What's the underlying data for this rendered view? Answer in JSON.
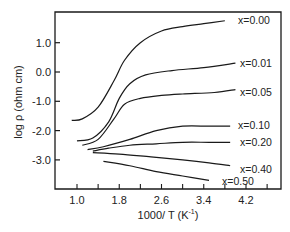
{
  "chart_data": {
    "type": "line",
    "title": "",
    "xlabel": "1000/ T (K⁻¹)",
    "ylabel": "log ρ (ohm cm)",
    "xlim": [
      0.6,
      4.6
    ],
    "ylim": [
      -4.0,
      2.1
    ],
    "xticks": [
      1.0,
      1.8,
      2.6,
      3.4,
      4.2
    ],
    "xtick_labels": [
      "1.0",
      "1.8",
      "2.6",
      "3.4",
      "4.2"
    ],
    "yticks": [
      1.0,
      0.0,
      -1.0,
      -2.0,
      -3.0
    ],
    "ytick_labels": [
      "1.0",
      "0.0",
      "-1.0",
      "-2.0",
      "-3.0"
    ],
    "grid": false,
    "legend": "inline labels at right end of each curve",
    "series": [
      {
        "name": "x=0.00",
        "x": [
          0.9,
          1.1,
          1.4,
          1.7,
          1.9,
          2.2,
          2.6,
          3.0,
          3.4,
          3.8
        ],
        "y": [
          -1.65,
          -1.6,
          -1.2,
          -0.3,
          0.4,
          1.0,
          1.4,
          1.55,
          1.65,
          1.75
        ]
      },
      {
        "name": "x=0.01",
        "x": [
          1.0,
          1.3,
          1.6,
          1.8,
          2.0,
          2.3,
          2.8,
          3.4,
          4.0
        ],
        "y": [
          -2.35,
          -2.25,
          -1.7,
          -0.9,
          -0.4,
          -0.1,
          0.05,
          0.15,
          0.3
        ]
      },
      {
        "name": "x=0.05",
        "x": [
          1.1,
          1.4,
          1.7,
          1.9,
          2.2,
          2.6,
          3.0,
          3.6,
          4.0
        ],
        "y": [
          -2.5,
          -2.3,
          -1.6,
          -1.1,
          -0.9,
          -0.8,
          -0.75,
          -0.7,
          -0.6
        ]
      },
      {
        "name": "x=0.10",
        "x": [
          1.2,
          1.5,
          2.0,
          2.5,
          3.0,
          3.5,
          3.9
        ],
        "y": [
          -2.65,
          -2.55,
          -2.3,
          -2.0,
          -1.85,
          -1.85,
          -1.85
        ]
      },
      {
        "name": "x=0.20",
        "x": [
          1.3,
          1.6,
          2.0,
          2.5,
          3.0,
          3.5,
          3.9
        ],
        "y": [
          -2.7,
          -2.6,
          -2.5,
          -2.45,
          -2.4,
          -2.4,
          -2.4
        ]
      },
      {
        "name": "x=0.40",
        "x": [
          1.3,
          1.8,
          2.4,
          3.0,
          3.5,
          3.9
        ],
        "y": [
          -2.75,
          -2.8,
          -2.9,
          -3.0,
          -3.1,
          -3.2
        ]
      },
      {
        "name": "x=0.50",
        "x": [
          1.5,
          2.0,
          2.5,
          3.0,
          3.5
        ],
        "y": [
          -3.05,
          -3.2,
          -3.4,
          -3.55,
          -3.7
        ]
      }
    ]
  },
  "axes": {
    "x_title_main": "1000/ T (K",
    "x_title_sup": "-1",
    "x_title_close": ")",
    "y_title": "log ρ (ohm cm)"
  },
  "colors": {
    "line": "#1a1a1a",
    "background": "#ffffff"
  }
}
